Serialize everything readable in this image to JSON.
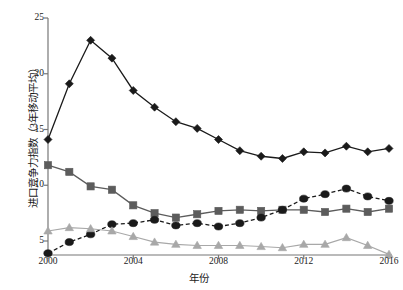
{
  "chart_data": {
    "type": "line",
    "title": "",
    "xlabel": "年份",
    "ylabel": "进口竞争力指数（3年移动平均）",
    "x": [
      2000,
      2001,
      2002,
      2003,
      2004,
      2005,
      2006,
      2007,
      2008,
      2009,
      2010,
      2011,
      2012,
      2013,
      2014,
      2015,
      2016
    ],
    "xlim": [
      2000,
      2016
    ],
    "ylim": [
      3,
      25
    ],
    "xticks": [
      2000,
      2004,
      2008,
      2012,
      2016
    ],
    "yticks": [
      5,
      10,
      15,
      20,
      25
    ],
    "grid": false,
    "legend_position": "none",
    "series": [
      {
        "name": "series-diamond",
        "marker": "diamond",
        "linestyle": "solid",
        "color": "#1a1a1a",
        "values": [
          14.1,
          19.1,
          23.0,
          21.4,
          18.5,
          17.0,
          15.7,
          15.1,
          14.1,
          13.1,
          12.6,
          12.4,
          13.0,
          12.9,
          13.5,
          13.0,
          13.3
        ]
      },
      {
        "name": "series-square",
        "marker": "square",
        "linestyle": "solid",
        "color": "#5c5c5c",
        "values": [
          11.8,
          11.2,
          9.9,
          9.6,
          8.2,
          7.5,
          7.1,
          7.4,
          7.7,
          7.8,
          7.7,
          7.8,
          7.8,
          7.6,
          7.9,
          7.6,
          7.9
        ]
      },
      {
        "name": "series-circle",
        "marker": "circle",
        "linestyle": "dashed",
        "color": "#1a1a1a",
        "values": [
          3.9,
          4.9,
          5.6,
          6.5,
          6.6,
          6.9,
          6.4,
          6.6,
          6.3,
          6.6,
          7.1,
          7.8,
          8.8,
          9.2,
          9.7,
          9.0,
          8.6
        ]
      },
      {
        "name": "series-triangle",
        "marker": "triangle",
        "linestyle": "solid",
        "color": "#a8a8a8",
        "values": [
          5.9,
          6.2,
          6.1,
          5.9,
          5.4,
          4.9,
          4.7,
          4.6,
          4.6,
          4.6,
          4.5,
          4.4,
          4.7,
          4.7,
          5.3,
          4.6,
          3.8
        ]
      }
    ]
  },
  "axes": {
    "x_tick_labels": [
      "2000",
      "2004",
      "2008",
      "2012",
      "2016"
    ],
    "y_tick_labels": [
      "5",
      "10",
      "15",
      "20",
      "25"
    ]
  }
}
